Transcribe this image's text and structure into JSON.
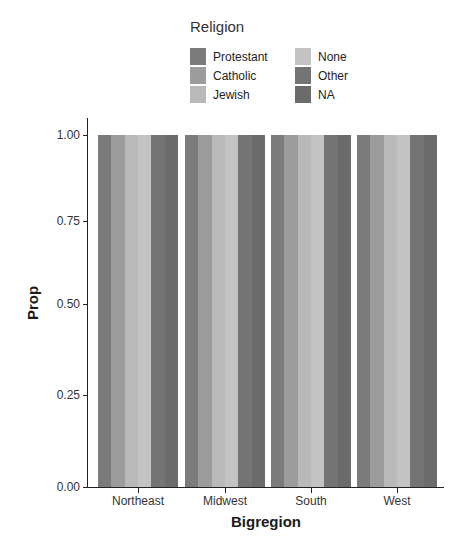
{
  "chart_data": {
    "type": "bar",
    "title": "",
    "xlabel": "Bigregion",
    "ylabel": "Prop",
    "ylim": [
      0,
      1
    ],
    "yticks": [
      "0.00",
      "0.25",
      "0.50",
      "0.75",
      "1.00"
    ],
    "categories": [
      "Northeast",
      "Midwest",
      "South",
      "West"
    ],
    "legend": {
      "title": "Religion",
      "position": "top",
      "entries": [
        "Protestant",
        "Catholic",
        "Jewish",
        "None",
        "Other",
        "NA"
      ]
    },
    "series": [
      {
        "name": "Protestant",
        "color": "#7b7b7b",
        "values": [
          1,
          1,
          1,
          1
        ]
      },
      {
        "name": "Catholic",
        "color": "#9c9c9c",
        "values": [
          1,
          1,
          1,
          1
        ]
      },
      {
        "name": "Jewish",
        "color": "#b9b9b9",
        "values": [
          1,
          1,
          1,
          1
        ]
      },
      {
        "name": "None",
        "color": "#c3c3c3",
        "values": [
          1,
          1,
          1,
          1
        ]
      },
      {
        "name": "Other",
        "color": "#747474",
        "values": [
          1,
          1,
          1,
          1
        ]
      },
      {
        "name": "NA",
        "color": "#6b6b6b",
        "values": [
          1,
          1,
          1,
          1
        ]
      }
    ],
    "grid": false,
    "position": "dodge"
  },
  "legend": {
    "title": "Religion",
    "col1": [
      "Protestant",
      "Catholic",
      "Jewish"
    ],
    "col2": [
      "None",
      "Other",
      "NA"
    ]
  },
  "axes": {
    "xlabel": "Bigregion",
    "ylabel": "Prop",
    "xticks": [
      "Northeast",
      "Midwest",
      "South",
      "West"
    ],
    "yticks": [
      "0.00",
      "0.25",
      "0.50",
      "0.75",
      "1.00"
    ]
  }
}
